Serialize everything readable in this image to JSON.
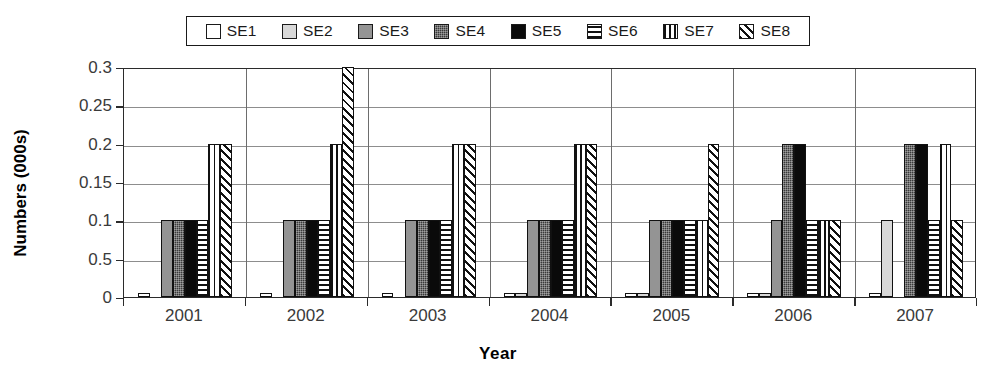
{
  "chart_data": {
    "type": "bar",
    "title": "",
    "xlabel": "Year",
    "ylabel": "Numbers (000s)",
    "categories": [
      "2001",
      "2002",
      "2003",
      "2004",
      "2005",
      "2006",
      "2007"
    ],
    "ylim": [
      0,
      0.3
    ],
    "ytick_labels": [
      "0.3",
      "0.25",
      "0.2",
      "0.15",
      "0.1",
      "0.5",
      "0"
    ],
    "ytick_values": [
      0.3,
      0.25,
      0.2,
      0.15,
      0.1,
      0.05,
      0
    ],
    "grid": true,
    "legend_position": "top",
    "series": [
      {
        "name": "SE1",
        "pattern": "open-white",
        "values": [
          0.005,
          0.005,
          0.005,
          0.005,
          0.005,
          0.005,
          0.005
        ]
      },
      {
        "name": "SE2",
        "pattern": "light-gray",
        "values": [
          0,
          0,
          0,
          0.005,
          0.005,
          0.005,
          0.1
        ]
      },
      {
        "name": "SE3",
        "pattern": "medium-gray",
        "values": [
          0.1,
          0.1,
          0.1,
          0.1,
          0.1,
          0.1,
          0
        ]
      },
      {
        "name": "SE4",
        "pattern": "dark-dotted",
        "values": [
          0.1,
          0.1,
          0.1,
          0.1,
          0.1,
          0.2,
          0.2
        ]
      },
      {
        "name": "SE5",
        "pattern": "solid-black",
        "values": [
          0.1,
          0.1,
          0.1,
          0.1,
          0.1,
          0.2,
          0.2
        ]
      },
      {
        "name": "SE6",
        "pattern": "horizontal-stripe",
        "values": [
          0.1,
          0.1,
          0.1,
          0.1,
          0.1,
          0.1,
          0.1
        ]
      },
      {
        "name": "SE7",
        "pattern": "vertical-stripe",
        "values": [
          0.2,
          0.2,
          0.2,
          0.2,
          0.1,
          0.1,
          0.2
        ]
      },
      {
        "name": "SE8",
        "pattern": "diagonal-hatch",
        "values": [
          0.2,
          0.3,
          0.2,
          0.2,
          0.2,
          0.1,
          0.1
        ]
      }
    ]
  },
  "legend": {
    "items": [
      {
        "label": "SE1"
      },
      {
        "label": "SE2"
      },
      {
        "label": "SE3"
      },
      {
        "label": "SE4"
      },
      {
        "label": "SE5"
      },
      {
        "label": "SE6"
      },
      {
        "label": "SE7"
      },
      {
        "label": "SE8"
      }
    ]
  }
}
